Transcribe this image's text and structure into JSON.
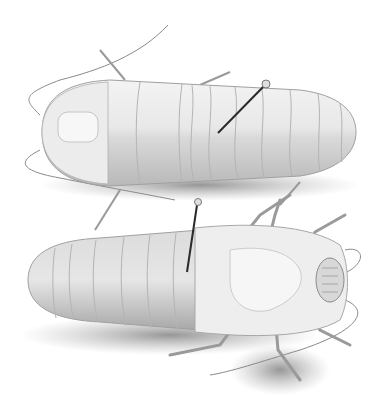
{
  "image": {
    "subject": "Illustration of two pinned insects (dorsal and ventral views)",
    "style": "grayscale pencil illustration",
    "background": "#ffffff",
    "colors": {
      "body_light": "#f1f1f1",
      "body_mid": "#d4d4d4",
      "body_dark": "#9a9a9a",
      "shadow": "#7a7a7a",
      "pin": "#2a2a2a",
      "line": "#8a8a8a"
    },
    "figures": [
      {
        "name": "dorsal-view-insect",
        "pinned": true
      },
      {
        "name": "ventral-view-insect",
        "pinned": true
      }
    ]
  }
}
